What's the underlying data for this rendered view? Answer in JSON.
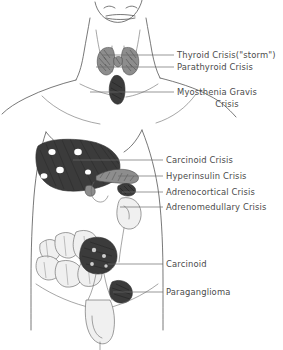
{
  "figure": {
    "background_color": "#ffffff",
    "ink_color": "#555555",
    "text_color": "#4a4a4a",
    "panels": [
      {
        "name": "head-neck-chest-panel",
        "region": "neck, thyroid, thymus"
      },
      {
        "name": "abdomen-pelvis-panel",
        "region": "liver, pancreas, adrenals, kidney, bowel, pelvis"
      }
    ]
  },
  "labels": [
    {
      "id": "thyroid-crisis",
      "text": "Thyroid Crisis(\"storm\")",
      "x": 177,
      "y": 50,
      "leader_from_x": 102,
      "leader_from_y": 55,
      "leader_to_x": 174,
      "leader_to_y": 55
    },
    {
      "id": "parathyroid-crisis",
      "text": "Parathyroid Crisis",
      "x": 177,
      "y": 62,
      "leader_from_x": 96,
      "leader_from_y": 67,
      "leader_to_x": 174,
      "leader_to_y": 67
    },
    {
      "id": "myasthenia-gravis-1",
      "text": "Myosthenia Gravis",
      "x": 177,
      "y": 87,
      "leader_from_x": 90,
      "leader_from_y": 92,
      "leader_to_x": 174,
      "leader_to_y": 92
    },
    {
      "id": "myasthenia-gravis-2",
      "text": "Crisis",
      "x": 203,
      "y": 99,
      "leader_from_x": null,
      "leader_from_y": null,
      "leader_to_x": null,
      "leader_to_y": null
    },
    {
      "id": "carcinoid-crisis",
      "text": "Carcinoid Crisis",
      "x": 166,
      "y": 155,
      "leader_from_x": 73,
      "leader_from_y": 160,
      "leader_to_x": 163,
      "leader_to_y": 160
    },
    {
      "id": "hyperinsulin-crisis",
      "text": "Hyperinsulin Crisis",
      "x": 166,
      "y": 171,
      "leader_from_x": 118,
      "leader_from_y": 176,
      "leader_to_x": 163,
      "leader_to_y": 176
    },
    {
      "id": "adrenocortical-crisis",
      "text": "Adrenocortical Crisis",
      "x": 166,
      "y": 187,
      "leader_from_x": 122,
      "leader_from_y": 192,
      "leader_to_x": 163,
      "leader_to_y": 192
    },
    {
      "id": "adrenomedullary-crisis",
      "text": "Adrenomedullary Crisis",
      "x": 166,
      "y": 202,
      "leader_from_x": 120,
      "leader_from_y": 207,
      "leader_to_x": 163,
      "leader_to_y": 207
    },
    {
      "id": "carcinoid",
      "text": "Carcinoid",
      "x": 166,
      "y": 259,
      "leader_from_x": 108,
      "leader_from_y": 264,
      "leader_to_x": 163,
      "leader_to_y": 264
    },
    {
      "id": "paraganglioma",
      "text": "Paraganglioma",
      "x": 166,
      "y": 287,
      "leader_from_x": 113,
      "leader_from_y": 292,
      "leader_to_x": 163,
      "leader_to_y": 292
    }
  ],
  "organs": [
    {
      "name": "thyroid-gland",
      "panel": "neck",
      "shading": "hatched-mid"
    },
    {
      "name": "thymus-gland",
      "panel": "neck",
      "shading": "dark"
    },
    {
      "name": "liver",
      "panel": "abdomen",
      "shading": "dark-hatched",
      "nodules": 5
    },
    {
      "name": "pancreas",
      "panel": "abdomen",
      "shading": "mid"
    },
    {
      "name": "adrenal-gland",
      "panel": "abdomen",
      "shading": "dark"
    },
    {
      "name": "kidney",
      "panel": "abdomen",
      "shading": "light"
    },
    {
      "name": "small-intestine",
      "panel": "abdomen",
      "shading": "light"
    },
    {
      "name": "carcinoid-tumor",
      "panel": "abdomen",
      "shading": "dark-mottled"
    },
    {
      "name": "paraganglioma-mass",
      "panel": "abdomen",
      "shading": "dark"
    },
    {
      "name": "bladder",
      "panel": "abdomen",
      "shading": "light"
    }
  ]
}
